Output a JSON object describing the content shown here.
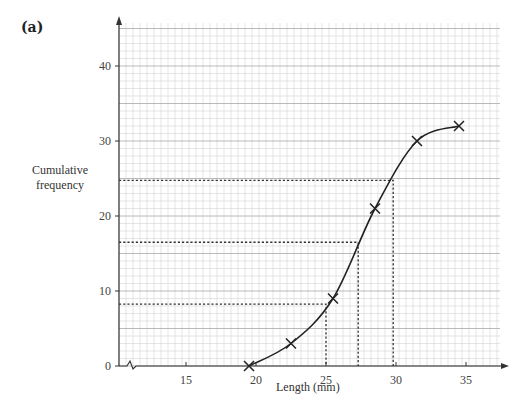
{
  "part_label": "(a)",
  "chart_data": {
    "type": "line",
    "title": "",
    "xlabel": "Length (mm)",
    "ylabel": "Cumulative frequency",
    "xlim": [
      10,
      37
    ],
    "ylim": [
      0,
      45
    ],
    "x_ticks": [
      15,
      20,
      25,
      30,
      35
    ],
    "y_ticks": [
      0,
      10,
      20,
      30,
      40
    ],
    "x_axis_break": true,
    "grid": true,
    "points": [
      {
        "x": 19.5,
        "y": 0
      },
      {
        "x": 22.5,
        "y": 3
      },
      {
        "x": 25.5,
        "y": 9
      },
      {
        "x": 28.5,
        "y": 21
      },
      {
        "x": 31.5,
        "y": 30
      },
      {
        "x": 34.5,
        "y": 32
      }
    ],
    "marker": "x",
    "curve": "smooth",
    "reading_lines": [
      {
        "name": "lower-quartile",
        "y": 8.25,
        "x": 25.0
      },
      {
        "name": "median",
        "y": 16.5,
        "x": 27.3
      },
      {
        "name": "upper-quartile",
        "y": 24.75,
        "x": 29.8
      }
    ]
  },
  "labels": {
    "ylabel_line1": "Cumulative",
    "ylabel_line2": "frequency",
    "xlabel": "Length (mm)"
  },
  "colors": {
    "grid_minor": "#d4d4d4",
    "grid_major": "#a8a8a8",
    "axis": "#333333",
    "curve": "#222222"
  }
}
